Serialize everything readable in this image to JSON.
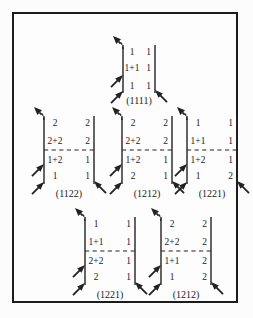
{
  "figure": {
    "background": "#fdfdfd",
    "border_color": "#1b1b1b",
    "ink_color": "#222222",
    "diagrams": [
      {
        "label": "(1111)",
        "rows": [
          {
            "left": "1",
            "right": "1"
          },
          {
            "left": "1+1",
            "right": "1"
          },
          {
            "left": "1",
            "right": "1"
          }
        ],
        "divider_after_row": null,
        "arrows": [
          {
            "name": "out-arrow-top-left",
            "type": "dashed-out",
            "side": "left",
            "position": "top"
          },
          {
            "name": "in-arrow-left-middle",
            "type": "solid-in",
            "side": "left",
            "position": "middle"
          },
          {
            "name": "in-arrow-left-bottom",
            "type": "solid-in",
            "side": "left",
            "position": "bottom"
          },
          {
            "name": "in-arrow-right-bottom",
            "type": "solid-in",
            "side": "right",
            "position": "bottom"
          }
        ]
      },
      {
        "label": "(1122)",
        "rows": [
          {
            "left": "2",
            "right": "2"
          },
          {
            "left": "2+2",
            "right": "2"
          },
          {
            "left": "1+2",
            "right": "1"
          },
          {
            "left": "1",
            "right": "1"
          }
        ],
        "divider_after_row": 1,
        "arrows": [
          {
            "name": "out-arrow-top-left",
            "type": "dashed-out",
            "side": "left",
            "position": "top"
          },
          {
            "name": "in-arrow-left-middle",
            "type": "solid-in",
            "side": "left",
            "position": "middle"
          },
          {
            "name": "in-arrow-left-bottom",
            "type": "solid-in",
            "side": "left",
            "position": "bottom"
          },
          {
            "name": "in-arrow-right-bottom",
            "type": "solid-in",
            "side": "right",
            "position": "bottom"
          }
        ]
      },
      {
        "label": "(1212)",
        "rows": [
          {
            "left": "2",
            "right": "2"
          },
          {
            "left": "2+2",
            "right": "2"
          },
          {
            "left": "1+2",
            "right": "1"
          },
          {
            "left": "2",
            "right": "1"
          }
        ],
        "divider_after_row": 1,
        "arrows": [
          {
            "name": "out-arrow-top-left",
            "type": "dashed-out",
            "side": "left",
            "position": "top"
          },
          {
            "name": "in-arrow-left-middle",
            "type": "solid-in",
            "side": "left",
            "position": "middle"
          },
          {
            "name": "in-arrow-left-bottom",
            "type": "solid-in",
            "side": "left",
            "position": "bottom"
          },
          {
            "name": "in-arrow-right-bottom",
            "type": "solid-in",
            "side": "right",
            "position": "bottom"
          }
        ]
      },
      {
        "label": "(1221)",
        "rows": [
          {
            "left": "1",
            "right": "1"
          },
          {
            "left": "1+1",
            "right": "1"
          },
          {
            "left": "1+2",
            "right": "1"
          },
          {
            "left": "1",
            "right": "2"
          }
        ],
        "divider_after_row": 1,
        "arrows": [
          {
            "name": "out-arrow-top-left",
            "type": "dashed-out",
            "side": "left",
            "position": "top"
          },
          {
            "name": "in-arrow-left-middle",
            "type": "solid-in",
            "side": "left",
            "position": "middle"
          },
          {
            "name": "in-arrow-left-bottom",
            "type": "solid-in",
            "side": "left",
            "position": "bottom"
          },
          {
            "name": "in-arrow-right-bottom",
            "type": "solid-in",
            "side": "right",
            "position": "bottom"
          }
        ]
      },
      {
        "label": "(1221)",
        "rows": [
          {
            "left": "1",
            "right": "1"
          },
          {
            "left": "1+1",
            "right": "1"
          },
          {
            "left": "2+2",
            "right": "1"
          },
          {
            "left": "2",
            "right": "1"
          }
        ],
        "divider_after_row": 1,
        "arrows": [
          {
            "name": "out-arrow-top-left",
            "type": "dashed-out",
            "side": "left",
            "position": "top"
          },
          {
            "name": "in-arrow-left-middle",
            "type": "solid-in",
            "side": "left",
            "position": "middle"
          },
          {
            "name": "in-arrow-left-bottom",
            "type": "solid-in",
            "side": "left",
            "position": "bottom"
          },
          {
            "name": "in-arrow-right-bottom",
            "type": "solid-in",
            "side": "right",
            "position": "bottom"
          }
        ]
      },
      {
        "label": "(1212)",
        "rows": [
          {
            "left": "2",
            "right": "2"
          },
          {
            "left": "2+2",
            "right": "2"
          },
          {
            "left": "1+1",
            "right": "2"
          },
          {
            "left": "1",
            "right": "2"
          }
        ],
        "divider_after_row": 1,
        "arrows": [
          {
            "name": "out-arrow-top-left",
            "type": "dashed-out",
            "side": "left",
            "position": "top"
          },
          {
            "name": "in-arrow-left-middle",
            "type": "solid-in",
            "side": "left",
            "position": "middle"
          },
          {
            "name": "in-arrow-left-bottom",
            "type": "solid-in",
            "side": "left",
            "position": "bottom"
          },
          {
            "name": "in-arrow-right-bottom",
            "type": "solid-in",
            "side": "right",
            "position": "bottom"
          }
        ]
      }
    ]
  }
}
